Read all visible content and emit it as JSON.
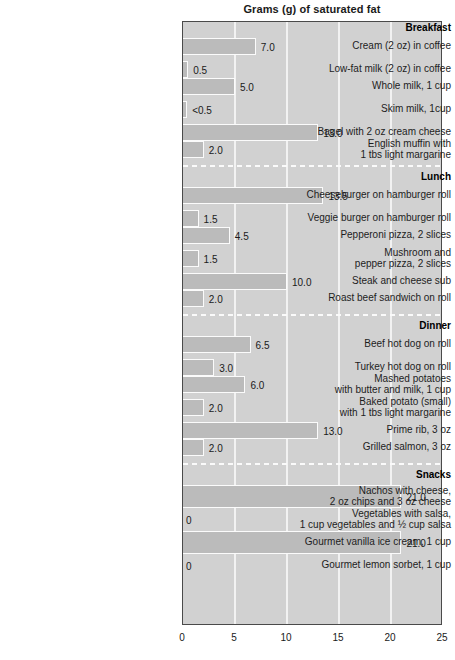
{
  "chart_data": {
    "type": "bar",
    "orientation": "horizontal",
    "title": "Grams (g) of saturated fat",
    "xlabel": "",
    "ylabel": "",
    "xlim": [
      0,
      25
    ],
    "xticks": [
      0,
      5,
      10,
      15,
      20,
      25
    ],
    "xtick_labels": [
      "0",
      "5",
      "10",
      "15",
      "20",
      "25"
    ],
    "grid": true,
    "grid_axis": "x",
    "legend": false,
    "units": "grams (g) of saturated fat",
    "sections": [
      {
        "name": "Breakfast",
        "items": [
          {
            "label": "Cream (2 oz) in coffee",
            "value": 7.0,
            "value_label": "7.0"
          },
          {
            "label": "Low-fat milk (2 oz) in coffee",
            "value": 0.5,
            "value_label": "0.5"
          },
          {
            "label": "Whole milk, 1 cup",
            "value": 5.0,
            "value_label": "5.0"
          },
          {
            "label": "Skim milk, 1cup",
            "value": 0.4,
            "value_label": "<0.5"
          },
          {
            "label": "Bagel with 2 oz cream cheese",
            "value": 13.0,
            "value_label": "13.0"
          },
          {
            "label": "English muffin with\n1 tbs light margarine",
            "value": 2.0,
            "value_label": "2.0"
          }
        ]
      },
      {
        "name": "Lunch",
        "items": [
          {
            "label": "Cheeseburger on hamburger roll",
            "value": 13.5,
            "value_label": "13.5"
          },
          {
            "label": "Veggie burger on hamburger roll",
            "value": 1.5,
            "value_label": "1.5"
          },
          {
            "label": "Pepperoni pizza, 2 slices",
            "value": 4.5,
            "value_label": "4.5"
          },
          {
            "label": "Mushroom and\npepper pizza, 2 slices",
            "value": 1.5,
            "value_label": "1.5"
          },
          {
            "label": "Steak and cheese sub",
            "value": 10.0,
            "value_label": "10.0"
          },
          {
            "label": "Roast beef sandwich on roll",
            "value": 2.0,
            "value_label": "2.0"
          }
        ]
      },
      {
        "name": "Dinner",
        "items": [
          {
            "label": "Beef hot dog on roll",
            "value": 6.5,
            "value_label": "6.5"
          },
          {
            "label": "Turkey hot dog on roll",
            "value": 3.0,
            "value_label": "3.0"
          },
          {
            "label": "Mashed potatoes\nwith butter and milk, 1 cup",
            "value": 6.0,
            "value_label": "6.0"
          },
          {
            "label": "Baked potato (small)\nwith 1 tbs light margarine",
            "value": 2.0,
            "value_label": "2.0"
          },
          {
            "label": "Prime rib, 3 oz",
            "value": 13.0,
            "value_label": "13.0"
          },
          {
            "label": "Grilled salmon, 3 oz",
            "value": 2.0,
            "value_label": "2.0"
          }
        ]
      },
      {
        "name": "Snacks",
        "items": [
          {
            "label": "Nachos with cheese,\n2 oz chips and 3 oz cheese",
            "value": 21.0,
            "value_label": "21.0"
          },
          {
            "label": "Vegetables with salsa,\n1 cup vegetables and ½ cup salsa",
            "value": 0,
            "value_label": "0"
          },
          {
            "label": "Gourmet vanilla ice cream, 1 cup",
            "value": 21.0,
            "value_label": "21.0"
          },
          {
            "label": "Gourmet lemon sorbet, 1 cup",
            "value": 0,
            "value_label": "0"
          }
        ]
      }
    ]
  },
  "colors": {
    "plot_background": "#d1d1d1",
    "bar_fill": "#bbbbbb",
    "bar_outline": "#fbfbfb",
    "gridline": "#f2f2f2",
    "axis": "#4a4a4a",
    "text": "#1a1a1a"
  }
}
